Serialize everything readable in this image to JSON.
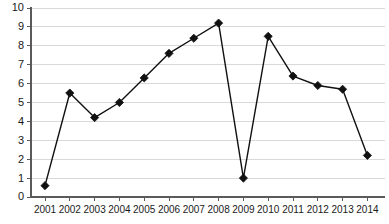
{
  "chart_data": {
    "type": "line",
    "title": "",
    "subtitle": "",
    "xlabel": "",
    "ylabel": "",
    "categories": [
      "2001",
      "2002",
      "2003",
      "2004",
      "2005",
      "2006",
      "2007",
      "2008",
      "2009",
      "2010",
      "2011",
      "2012",
      "2013",
      "2014"
    ],
    "values": [
      0.6,
      5.5,
      4.2,
      5.0,
      6.3,
      7.6,
      8.4,
      9.2,
      1.0,
      8.5,
      6.4,
      5.9,
      5.7,
      2.2
    ],
    "series": [
      {
        "name": "series-1",
        "values": [
          0.6,
          5.5,
          4.2,
          5.0,
          6.3,
          7.6,
          8.4,
          9.2,
          1.0,
          8.5,
          6.4,
          5.9,
          5.7,
          2.2
        ]
      }
    ],
    "ylim": [
      0,
      10
    ],
    "yticks": [
      0,
      1,
      2,
      3,
      4,
      5,
      6,
      7,
      8,
      9,
      10
    ],
    "ytick_labels": [
      "0",
      "1",
      "2",
      "3",
      "4",
      "5",
      "6",
      "7",
      "8",
      "9",
      "10"
    ],
    "xtick_labels": [
      "2001",
      "2002",
      "2003",
      "2004",
      "2005",
      "2006",
      "2007",
      "2008",
      "2009",
      "2010",
      "2011",
      "2012",
      "2013",
      "2014"
    ],
    "grid": true,
    "grid_axis": "y",
    "legend": false,
    "legend_position": "none",
    "marker": "diamond",
    "colors": {
      "line": "#111111",
      "marker": "#111111",
      "grid": "#d9d9d9",
      "axis": "#5a5a5a",
      "text": "#1a1a1a",
      "background": "#ffffff"
    },
    "annotations": []
  }
}
